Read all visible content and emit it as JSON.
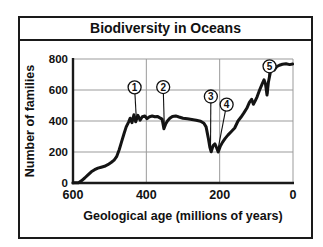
{
  "chart_data": {
    "type": "line",
    "title": "Biodiversity in Oceans",
    "xlabel": "Geological age (millions of years)",
    "ylabel": "Number of families",
    "xlim": [
      600,
      0
    ],
    "ylim": [
      0,
      800
    ],
    "x_ticks": [
      600,
      400,
      200,
      0
    ],
    "y_ticks": [
      0,
      200,
      400,
      600,
      800
    ],
    "grid": true,
    "legend": "none",
    "colors": {
      "line": "#141414",
      "axis": "#1a1a1a",
      "grid": "#9b9b9b",
      "background": "#ffffff",
      "marker_fill": "#ffffff",
      "marker_stroke": "#111111"
    },
    "series": [
      {
        "name": "Number of families",
        "points": [
          [
            600,
            2
          ],
          [
            585,
            2
          ],
          [
            577,
            14
          ],
          [
            568,
            32
          ],
          [
            559,
            52
          ],
          [
            550,
            72
          ],
          [
            541,
            86
          ],
          [
            532,
            96
          ],
          [
            523,
            102
          ],
          [
            514,
            108
          ],
          [
            505,
            118
          ],
          [
            496,
            132
          ],
          [
            488,
            148
          ],
          [
            481,
            170
          ],
          [
            474,
            215
          ],
          [
            468,
            262
          ],
          [
            461,
            318
          ],
          [
            455,
            362
          ],
          [
            448,
            395
          ],
          [
            444,
            418
          ],
          [
            439,
            390
          ],
          [
            434,
            440
          ],
          [
            429,
            395
          ],
          [
            423,
            437
          ],
          [
            417,
            405
          ],
          [
            411,
            428
          ],
          [
            404,
            432
          ],
          [
            398,
            415
          ],
          [
            391,
            428
          ],
          [
            384,
            432
          ],
          [
            377,
            428
          ],
          [
            370,
            430
          ],
          [
            363,
            420
          ],
          [
            357,
            412
          ],
          [
            352,
            350
          ],
          [
            347,
            382
          ],
          [
            342,
            402
          ],
          [
            336,
            418
          ],
          [
            329,
            430
          ],
          [
            320,
            433
          ],
          [
            311,
            426
          ],
          [
            300,
            418
          ],
          [
            288,
            414
          ],
          [
            276,
            410
          ],
          [
            264,
            405
          ],
          [
            252,
            399
          ],
          [
            243,
            385
          ],
          [
            237,
            362
          ],
          [
            231,
            290
          ],
          [
            227,
            232
          ],
          [
            223,
            202
          ],
          [
            218,
            242
          ],
          [
            213,
            252
          ],
          [
            208,
            226
          ],
          [
            204,
            200
          ],
          [
            198,
            238
          ],
          [
            192,
            264
          ],
          [
            185,
            288
          ],
          [
            177,
            310
          ],
          [
            168,
            332
          ],
          [
            159,
            355
          ],
          [
            150,
            400
          ],
          [
            142,
            424
          ],
          [
            134,
            452
          ],
          [
            126,
            482
          ],
          [
            119,
            520
          ],
          [
            113,
            540
          ],
          [
            108,
            508
          ],
          [
            103,
            530
          ],
          [
            98,
            556
          ],
          [
            91,
            600
          ],
          [
            84,
            640
          ],
          [
            79,
            666
          ],
          [
            75,
            638
          ],
          [
            71,
            568
          ],
          [
            67,
            650
          ],
          [
            62,
            712
          ],
          [
            57,
            742
          ],
          [
            51,
            730
          ],
          [
            45,
            750
          ],
          [
            37,
            760
          ],
          [
            29,
            766
          ],
          [
            19,
            769
          ],
          [
            9,
            764
          ],
          [
            1,
            768
          ]
        ]
      }
    ],
    "annotations": [
      {
        "label": "1",
        "circle_at": [
          432,
          617
        ],
        "points_to": [
          427,
          400
        ]
      },
      {
        "label": "2",
        "circle_at": [
          354,
          619
        ],
        "points_to": [
          351,
          368
        ]
      },
      {
        "label": "3",
        "circle_at": [
          224,
          558
        ],
        "points_to": [
          225,
          225
        ]
      },
      {
        "label": "4",
        "circle_at": [
          181,
          506
        ],
        "points_to": [
          204,
          225
        ]
      },
      {
        "label": "5",
        "circle_at": [
          64,
          753
        ],
        "points_to": [
          69,
          575
        ]
      }
    ]
  }
}
